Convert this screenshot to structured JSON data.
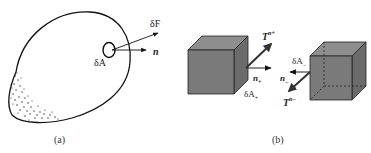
{
  "figure": {
    "panel_a": {
      "caption": "(a)",
      "labels": {
        "force": "δF",
        "normal": "n",
        "area": "δA"
      }
    },
    "panel_b": {
      "caption": "(b)",
      "left_cube": {
        "traction_main": "T",
        "traction_sup": "n+",
        "normal_main": "n",
        "normal_sub": "+",
        "area_main": "δA",
        "area_sub": "+"
      },
      "right_cube": {
        "traction_main": "T",
        "traction_sup": "n−",
        "normal_main": "n",
        "normal_sub": "−",
        "area_main": "δA",
        "area_sub": "−"
      }
    },
    "colors": {
      "line": "#111111",
      "cube_front": "#7a7a7a",
      "cube_top": "#8e8e8e",
      "cube_side": "#6a6a6a",
      "arrow_dark": "#333333"
    }
  }
}
